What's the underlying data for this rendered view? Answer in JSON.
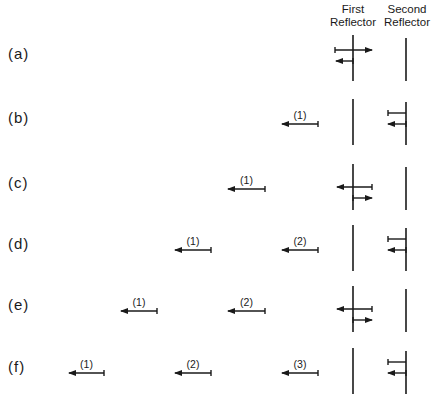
{
  "headers": {
    "first_reflector": [
      "First",
      "Reflector"
    ],
    "second_reflector": [
      "Second",
      "Reflector"
    ]
  },
  "reflectors": {
    "first_x": 353,
    "second_x": 406
  },
  "colors": {
    "ink": "#1a1a1a",
    "background": "#ffffff"
  },
  "rows": [
    {
      "label": "(a)",
      "y": 54,
      "pulses": [],
      "first_reflector": {
        "incident_right": true,
        "reflected_left": true,
        "transmitted_right": false
      },
      "second_reflector": {
        "incident": false,
        "reflected": false
      }
    },
    {
      "label": "(b)",
      "y": 118,
      "pulses": [
        {
          "label": "(1)",
          "x1": 282,
          "x2": 318
        }
      ],
      "first_reflector": {
        "incident_right": false,
        "reflected_left": false,
        "transmitted_right": false
      },
      "second_reflector": {
        "incident": true,
        "reflected": true
      }
    },
    {
      "label": "(c)",
      "y": 183,
      "pulses": [
        {
          "label": "(1)",
          "x1": 228,
          "x2": 265
        }
      ],
      "first_reflector": {
        "incident_right": false,
        "reflected_left": true,
        "transmitted_right": true
      },
      "second_reflector": {
        "incident": false,
        "reflected": false
      }
    },
    {
      "label": "(d)",
      "y": 244,
      "pulses": [
        {
          "label": "(1)",
          "x1": 175,
          "x2": 211
        },
        {
          "label": "(2)",
          "x1": 282,
          "x2": 318
        }
      ],
      "first_reflector": {
        "incident_right": false,
        "reflected_left": false,
        "transmitted_right": false
      },
      "second_reflector": {
        "incident": true,
        "reflected": true
      }
    },
    {
      "label": "(e)",
      "y": 305,
      "pulses": [
        {
          "label": "(1)",
          "x1": 121,
          "x2": 157
        },
        {
          "label": "(2)",
          "x1": 228,
          "x2": 265
        }
      ],
      "first_reflector": {
        "incident_right": false,
        "reflected_left": true,
        "transmitted_right": true
      },
      "second_reflector": {
        "incident": false,
        "reflected": false
      }
    },
    {
      "label": "(f)",
      "y": 367,
      "pulses": [
        {
          "label": "(1)",
          "x1": 69,
          "x2": 104
        },
        {
          "label": "(2)",
          "x1": 175,
          "x2": 211
        },
        {
          "label": "(3)",
          "x1": 282,
          "x2": 318
        }
      ],
      "first_reflector": {
        "incident_right": false,
        "reflected_left": false,
        "transmitted_right": false
      },
      "second_reflector": {
        "incident": true,
        "reflected": true
      }
    }
  ]
}
